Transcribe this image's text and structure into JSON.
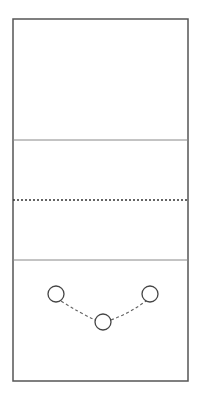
{
  "diagram": {
    "type": "volleyball-half-court",
    "court": {
      "x": 13,
      "y": 19,
      "width": 175,
      "height": 362,
      "stroke": "#555555"
    },
    "lines": [
      {
        "name": "attack-line-top",
        "y": 140,
        "style": "solid",
        "stroke": "#777777"
      },
      {
        "name": "net-line",
        "y": 200,
        "style": "dotted",
        "stroke": "#333333"
      },
      {
        "name": "attack-line-bottom",
        "y": 260,
        "style": "solid",
        "stroke": "#777777"
      }
    ],
    "players": [
      {
        "name": "player-left",
        "cx": 56,
        "cy": 294,
        "r": 8
      },
      {
        "name": "player-middle",
        "cx": 103,
        "cy": 322,
        "r": 8
      },
      {
        "name": "player-right",
        "cx": 150,
        "cy": 294,
        "r": 8
      }
    ],
    "path": {
      "style": "dashed",
      "stroke": "#555555"
    }
  }
}
